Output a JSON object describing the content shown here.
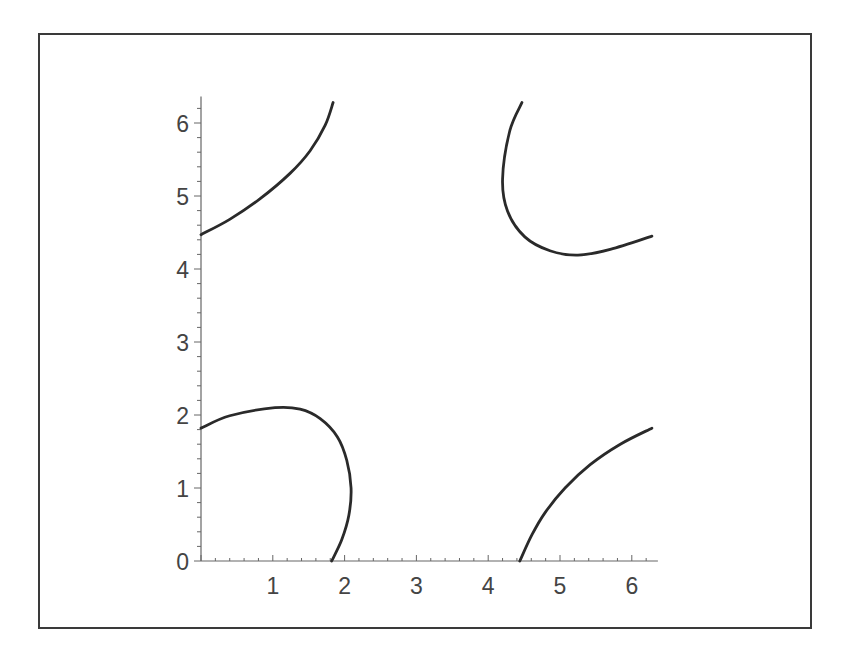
{
  "chart_data": {
    "type": "line",
    "title": "",
    "xlabel": "",
    "ylabel": "",
    "xlim": [
      0,
      6.28
    ],
    "ylim": [
      0,
      6.28
    ],
    "grid": false,
    "legend": null,
    "x_ticks": [
      "0",
      "1",
      "2",
      "3",
      "4",
      "5",
      "6"
    ],
    "y_ticks": [
      "0",
      "1",
      "2",
      "3",
      "4",
      "5",
      "6"
    ],
    "minor_ticks_per_unit": 5,
    "series": [
      {
        "name": "curve-bottom-left",
        "points": [
          [
            0.0,
            1.82
          ],
          [
            0.4,
            1.99
          ],
          [
            1.03,
            2.1
          ],
          [
            1.38,
            2.08
          ],
          [
            1.66,
            1.95
          ],
          [
            1.9,
            1.7
          ],
          [
            2.03,
            1.38
          ],
          [
            2.09,
            1.0
          ],
          [
            2.06,
            0.63
          ],
          [
            1.96,
            0.29
          ],
          [
            1.82,
            0.0
          ]
        ]
      },
      {
        "name": "curve-top-left",
        "points": [
          [
            0.0,
            4.47
          ],
          [
            0.4,
            4.68
          ],
          [
            0.82,
            4.96
          ],
          [
            1.24,
            5.31
          ],
          [
            1.52,
            5.62
          ],
          [
            1.73,
            5.97
          ],
          [
            1.84,
            6.28
          ]
        ]
      },
      {
        "name": "curve-top-right",
        "points": [
          [
            4.47,
            6.28
          ],
          [
            4.3,
            5.89
          ],
          [
            4.2,
            5.23
          ],
          [
            4.27,
            4.79
          ],
          [
            4.51,
            4.44
          ],
          [
            4.86,
            4.25
          ],
          [
            5.25,
            4.19
          ],
          [
            5.7,
            4.27
          ],
          [
            6.28,
            4.45
          ]
        ]
      },
      {
        "name": "curve-bottom-right",
        "points": [
          [
            4.44,
            0.0
          ],
          [
            4.61,
            0.36
          ],
          [
            4.79,
            0.66
          ],
          [
            5.07,
            1.0
          ],
          [
            5.42,
            1.32
          ],
          [
            5.84,
            1.6
          ],
          [
            6.28,
            1.82
          ]
        ]
      }
    ]
  },
  "style": {
    "curve_color": "#2a2a2a",
    "axis_color": "#666666",
    "label_color": "#444444"
  }
}
